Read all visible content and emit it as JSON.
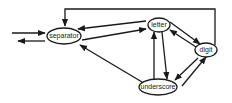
{
  "diagram": {
    "type": "state-transition",
    "nodes": [
      {
        "id": "separator",
        "label": "separator"
      },
      {
        "id": "letter",
        "label": "letter"
      },
      {
        "id": "digit",
        "label": "digit"
      },
      {
        "id": "underscore",
        "label": "underscore"
      }
    ],
    "edges": [
      {
        "from": "start",
        "to": "separator"
      },
      {
        "from": "separator",
        "to": "end"
      },
      {
        "from": "separator",
        "to": "letter"
      },
      {
        "from": "letter",
        "to": "separator"
      },
      {
        "from": "letter",
        "to": "digit"
      },
      {
        "from": "digit",
        "to": "letter"
      },
      {
        "from": "letter",
        "to": "underscore"
      },
      {
        "from": "underscore",
        "to": "letter"
      },
      {
        "from": "underscore",
        "to": "digit"
      },
      {
        "from": "digit",
        "to": "underscore"
      },
      {
        "from": "underscore",
        "to": "separator"
      },
      {
        "from": "digit",
        "to": "separator"
      }
    ]
  }
}
